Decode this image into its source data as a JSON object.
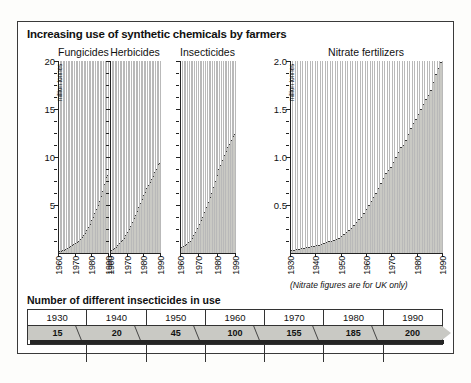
{
  "title": "Increasing use of synthetic chemicals by farmers",
  "note": "(Nitrate figures are for UK only)",
  "table": {
    "title": "Number of different insecticides in use",
    "headers": [
      "1930",
      "1940",
      "1950",
      "1960",
      "1970",
      "1980",
      "1990"
    ],
    "values": [
      "15",
      "20",
      "45",
      "100",
      "155",
      "185",
      "200"
    ]
  },
  "chart_data": [
    {
      "type": "bar",
      "title": "Fungicides",
      "xlabel": "",
      "ylabel": "million tonnes",
      "ylim": [
        0,
        20
      ],
      "yticks": [
        5,
        10,
        15,
        20
      ],
      "xticks": [
        "1960",
        "1970",
        "1980",
        "1990"
      ],
      "x": [
        1960,
        1961,
        1962,
        1963,
        1964,
        1965,
        1966,
        1967,
        1968,
        1969,
        1970,
        1971,
        1972,
        1973,
        1974,
        1975,
        1976,
        1977,
        1978,
        1979,
        1980,
        1981,
        1982,
        1983,
        1984,
        1985,
        1986,
        1987,
        1988,
        1989,
        1990
      ],
      "values": [
        0.2,
        0.25,
        0.3,
        0.35,
        0.4,
        0.5,
        0.6,
        0.7,
        0.8,
        0.9,
        1.0,
        1.1,
        1.3,
        1.5,
        1.7,
        1.9,
        2.1,
        2.4,
        2.7,
        3.0,
        3.4,
        3.8,
        4.2,
        4.6,
        5.0,
        5.4,
        5.9,
        6.5,
        7.2,
        7.9,
        8.1
      ],
      "grid": false,
      "legend": "none"
    },
    {
      "type": "bar",
      "title": "Herbicides",
      "xlabel": "",
      "ylabel": "million tonnes",
      "ylim": [
        0,
        20
      ],
      "yticks": [
        5,
        10,
        15,
        20
      ],
      "xticks": [
        "1960",
        "1970",
        "1980",
        "1990"
      ],
      "x": [
        1960,
        1961,
        1962,
        1963,
        1964,
        1965,
        1966,
        1967,
        1968,
        1969,
        1970,
        1971,
        1972,
        1973,
        1974,
        1975,
        1976,
        1977,
        1978,
        1979,
        1980,
        1981,
        1982,
        1983,
        1984,
        1985,
        1986,
        1987,
        1988,
        1989,
        1990
      ],
      "values": [
        0.3,
        0.4,
        0.5,
        0.6,
        0.8,
        1.0,
        1.2,
        1.4,
        1.6,
        1.9,
        2.2,
        2.5,
        2.8,
        3.2,
        3.6,
        4.0,
        4.4,
        4.8,
        5.2,
        5.6,
        6.0,
        6.4,
        6.8,
        7.1,
        7.4,
        7.7,
        8.0,
        8.4,
        8.8,
        9.3,
        9.4
      ],
      "grid": false,
      "legend": "none"
    },
    {
      "type": "bar",
      "title": "Insecticides",
      "xlabel": "",
      "ylabel": "million tonnes",
      "ylim": [
        0,
        20
      ],
      "yticks": [
        5,
        10,
        15,
        20
      ],
      "xticks": [
        "1960",
        "1970",
        "1980",
        "1990"
      ],
      "x": [
        1960,
        1961,
        1962,
        1963,
        1964,
        1965,
        1966,
        1967,
        1968,
        1969,
        1970,
        1971,
        1972,
        1973,
        1974,
        1975,
        1976,
        1977,
        1978,
        1979,
        1980,
        1981,
        1982,
        1983,
        1984,
        1985,
        1986,
        1987,
        1988,
        1989,
        1990
      ],
      "values": [
        0.6,
        0.7,
        0.8,
        0.9,
        1.1,
        1.3,
        1.6,
        1.9,
        2.2,
        2.6,
        3.0,
        3.4,
        3.8,
        4.3,
        4.8,
        5.3,
        5.8,
        6.3,
        6.9,
        7.5,
        8.1,
        8.7,
        9.2,
        9.7,
        10.2,
        10.6,
        11.0,
        11.4,
        11.8,
        12.2,
        12.4
      ],
      "grid": false,
      "legend": "none"
    },
    {
      "type": "bar",
      "title": "Nitrate fertilizers",
      "xlabel": "",
      "ylabel": "million tonnes",
      "ylim": [
        0,
        2.0
      ],
      "yticks": [
        0.5,
        1.0,
        1.5,
        2.0
      ],
      "ytick_labels": [
        "0.5",
        "1.0",
        "1.5",
        "2.0"
      ],
      "xticks": [
        "1930",
        "1940",
        "1950",
        "1960",
        "1970",
        "1980",
        "1990"
      ],
      "x": [
        1930,
        1931,
        1932,
        1933,
        1934,
        1935,
        1936,
        1937,
        1938,
        1939,
        1940,
        1941,
        1942,
        1943,
        1944,
        1945,
        1946,
        1947,
        1948,
        1949,
        1950,
        1951,
        1952,
        1953,
        1954,
        1955,
        1956,
        1957,
        1958,
        1959,
        1960,
        1961,
        1962,
        1963,
        1964,
        1965,
        1966,
        1967,
        1968,
        1969,
        1970,
        1971,
        1972,
        1973,
        1974,
        1975,
        1976,
        1977,
        1978,
        1979,
        1980,
        1981,
        1982,
        1983,
        1984,
        1985,
        1986,
        1987,
        1988,
        1989,
        1990
      ],
      "values": [
        0.03,
        0.035,
        0.04,
        0.045,
        0.05,
        0.055,
        0.06,
        0.065,
        0.07,
        0.075,
        0.08,
        0.085,
        0.09,
        0.1,
        0.11,
        0.12,
        0.13,
        0.14,
        0.15,
        0.16,
        0.18,
        0.2,
        0.22,
        0.24,
        0.26,
        0.29,
        0.32,
        0.35,
        0.38,
        0.42,
        0.46,
        0.5,
        0.54,
        0.58,
        0.63,
        0.68,
        0.73,
        0.78,
        0.83,
        0.86,
        0.9,
        0.95,
        1.0,
        1.05,
        1.1,
        1.13,
        1.18,
        1.24,
        1.3,
        1.35,
        1.4,
        1.45,
        1.5,
        1.55,
        1.6,
        1.65,
        1.7,
        1.78,
        1.86,
        1.93,
        1.99
      ],
      "grid": false,
      "legend": "none"
    }
  ]
}
